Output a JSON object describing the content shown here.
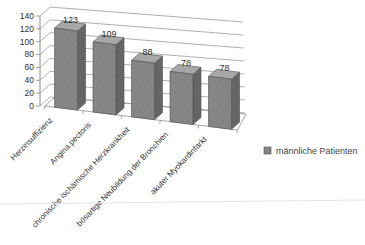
{
  "chart_data": {
    "type": "bar",
    "style": "3d-column",
    "categories": [
      "Herzinsuffizienz",
      "Angina pectoris",
      "chronische ischämische Herzkrankheit",
      "bösartige Neubildung der Bronchien",
      "akuter Myokardinfarkt"
    ],
    "series": [
      {
        "name": "männliche Patienten",
        "values": [
          123,
          109,
          88,
          78,
          78
        ]
      }
    ],
    "value_labels": [
      "123",
      "109",
      "88",
      "78",
      "78"
    ],
    "title": "",
    "xlabel": "",
    "ylabel": "",
    "ylim": [
      0,
      140
    ],
    "ytick_step": 20,
    "grid": true,
    "legend_position": "right-middle",
    "colors": {
      "bar_front": "#9c9c9c",
      "bar_front_dot": "#6e6e6e",
      "bar_side": "#787878",
      "bar_side_dot": "#525252",
      "bar_top": "#b6b6b6",
      "bar_top_dot": "#989898",
      "outline": "#4f4f4f",
      "gridline": "#9a9a9a",
      "axis": "#8a8a8a",
      "text": "#2e2e2e",
      "legend_text": "#3f3f3f",
      "scan_band": "#e4e4e4"
    }
  }
}
